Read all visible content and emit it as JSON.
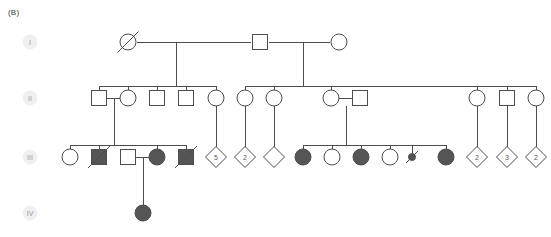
{
  "panel": {
    "label": "(B)"
  },
  "style": {
    "line_color": "#4d4d4d",
    "affected_fill": "#555555",
    "unaffected_fill": "#ffffff",
    "badge_fill": "#f0f0f0",
    "badge_text_color": "#9a9a9a",
    "background": "#ffffff"
  },
  "generations": [
    {
      "id": "I",
      "label": "I",
      "badge_x": 30,
      "badge_y": 42,
      "row_y": 42
    },
    {
      "id": "II",
      "label": "II",
      "badge_x": 30,
      "badge_y": 98,
      "row_y": 98
    },
    {
      "id": "III",
      "label": "III",
      "badge_x": 30,
      "badge_y": 157,
      "row_y": 157
    },
    {
      "id": "IV",
      "label": "IV",
      "badge_x": 30,
      "badge_y": 213,
      "row_y": 213
    }
  ],
  "symbols": [
    {
      "id": "I-1",
      "gen": "I",
      "sex": "female",
      "shape": "circle",
      "x": 128,
      "y": 42,
      "affected": false,
      "deceased": true,
      "count": null
    },
    {
      "id": "I-2",
      "gen": "I",
      "sex": "male",
      "shape": "square",
      "x": 260,
      "y": 42,
      "affected": false,
      "deceased": false,
      "count": null
    },
    {
      "id": "I-3",
      "gen": "I",
      "sex": "female",
      "shape": "circle",
      "x": 339,
      "y": 42,
      "affected": false,
      "deceased": false,
      "count": null
    },
    {
      "id": "II-1",
      "gen": "II",
      "sex": "male",
      "shape": "square",
      "x": 99,
      "y": 98,
      "affected": false,
      "deceased": false,
      "count": null
    },
    {
      "id": "II-2",
      "gen": "II",
      "sex": "female",
      "shape": "circle",
      "x": 128,
      "y": 98,
      "affected": false,
      "deceased": false,
      "count": null
    },
    {
      "id": "II-3",
      "gen": "II",
      "sex": "male",
      "shape": "square",
      "x": 157,
      "y": 98,
      "affected": false,
      "deceased": false,
      "count": null
    },
    {
      "id": "II-4",
      "gen": "II",
      "sex": "male",
      "shape": "square",
      "x": 186,
      "y": 98,
      "affected": false,
      "deceased": false,
      "count": null
    },
    {
      "id": "II-5",
      "gen": "II",
      "sex": "female",
      "shape": "circle",
      "x": 216,
      "y": 98,
      "affected": false,
      "deceased": false,
      "count": null
    },
    {
      "id": "II-6",
      "gen": "II",
      "sex": "female",
      "shape": "circle",
      "x": 245,
      "y": 98,
      "affected": false,
      "deceased": false,
      "count": null
    },
    {
      "id": "II-7",
      "gen": "II",
      "sex": "female",
      "shape": "circle",
      "x": 274,
      "y": 98,
      "affected": false,
      "deceased": false,
      "count": null
    },
    {
      "id": "II-8",
      "gen": "II",
      "sex": "female",
      "shape": "circle",
      "x": 331,
      "y": 98,
      "affected": false,
      "deceased": false,
      "count": null
    },
    {
      "id": "II-9",
      "gen": "II",
      "sex": "male",
      "shape": "square",
      "x": 360,
      "y": 98,
      "affected": false,
      "deceased": false,
      "count": null
    },
    {
      "id": "II-10",
      "gen": "II",
      "sex": "female",
      "shape": "circle",
      "x": 477,
      "y": 98,
      "affected": false,
      "deceased": false,
      "count": null
    },
    {
      "id": "II-11",
      "gen": "II",
      "sex": "male",
      "shape": "square",
      "x": 507,
      "y": 98,
      "affected": false,
      "deceased": false,
      "count": null
    },
    {
      "id": "II-12",
      "gen": "II",
      "sex": "female",
      "shape": "circle",
      "x": 536,
      "y": 98,
      "affected": false,
      "deceased": false,
      "count": null
    },
    {
      "id": "III-1",
      "gen": "III",
      "sex": "female",
      "shape": "circle",
      "x": 70,
      "y": 157,
      "affected": false,
      "deceased": false,
      "count": null
    },
    {
      "id": "III-2",
      "gen": "III",
      "sex": "male",
      "shape": "square",
      "x": 99,
      "y": 157,
      "affected": true,
      "deceased": true,
      "count": null
    },
    {
      "id": "III-3",
      "gen": "III",
      "sex": "male",
      "shape": "square",
      "x": 128,
      "y": 157,
      "affected": false,
      "deceased": false,
      "count": null
    },
    {
      "id": "III-4",
      "gen": "III",
      "sex": "female",
      "shape": "circle",
      "x": 157,
      "y": 157,
      "affected": true,
      "deceased": false,
      "count": null
    },
    {
      "id": "III-5",
      "gen": "III",
      "sex": "male",
      "shape": "square",
      "x": 186,
      "y": 157,
      "affected": true,
      "deceased": true,
      "count": null
    },
    {
      "id": "III-6",
      "gen": "III",
      "sex": "unknown",
      "shape": "diamond",
      "x": 216,
      "y": 157,
      "affected": false,
      "deceased": false,
      "count": "5"
    },
    {
      "id": "III-7",
      "gen": "III",
      "sex": "unknown",
      "shape": "diamond",
      "x": 245,
      "y": 157,
      "affected": false,
      "deceased": false,
      "count": "2"
    },
    {
      "id": "III-8",
      "gen": "III",
      "sex": "unknown",
      "shape": "diamond",
      "x": 274,
      "y": 157,
      "affected": false,
      "deceased": false,
      "count": null
    },
    {
      "id": "III-9",
      "gen": "III",
      "sex": "female",
      "shape": "circle",
      "x": 303,
      "y": 157,
      "affected": true,
      "deceased": false,
      "count": null
    },
    {
      "id": "III-10",
      "gen": "III",
      "sex": "female",
      "shape": "circle",
      "x": 332,
      "y": 157,
      "affected": false,
      "deceased": false,
      "count": null
    },
    {
      "id": "III-11",
      "gen": "III",
      "sex": "female",
      "shape": "circle",
      "x": 361,
      "y": 157,
      "affected": true,
      "deceased": false,
      "count": null
    },
    {
      "id": "III-12",
      "gen": "III",
      "sex": "female",
      "shape": "circle",
      "x": 390,
      "y": 157,
      "affected": false,
      "deceased": false,
      "count": null
    },
    {
      "id": "III-13",
      "gen": "III",
      "sex": "loss",
      "shape": "loss",
      "x": 412,
      "y": 157,
      "affected": true,
      "deceased": true,
      "count": null
    },
    {
      "id": "III-14",
      "gen": "III",
      "sex": "female",
      "shape": "circle",
      "x": 446,
      "y": 157,
      "affected": true,
      "deceased": false,
      "count": null
    },
    {
      "id": "III-15",
      "gen": "III",
      "sex": "unknown",
      "shape": "diamond",
      "x": 477,
      "y": 157,
      "affected": false,
      "deceased": false,
      "count": "2"
    },
    {
      "id": "III-16",
      "gen": "III",
      "sex": "unknown",
      "shape": "diamond",
      "x": 507,
      "y": 157,
      "affected": false,
      "deceased": false,
      "count": "3"
    },
    {
      "id": "III-17",
      "gen": "III",
      "sex": "unknown",
      "shape": "diamond",
      "x": 536,
      "y": 157,
      "affected": false,
      "deceased": false,
      "count": "2"
    },
    {
      "id": "IV-1",
      "gen": "IV",
      "sex": "female",
      "shape": "circle",
      "x": 143,
      "y": 213,
      "affected": true,
      "deceased": false,
      "count": null
    }
  ],
  "connectors": [
    {
      "id": "mate-I-1-I-2",
      "type": "mating-line",
      "points": "137,42 251,42"
    },
    {
      "id": "mate-I-2-I-3",
      "type": "mating-line",
      "points": "269,42 330,42"
    },
    {
      "id": "desc-I-1-drop",
      "type": "descent-drop",
      "points": "176,42 176,86"
    },
    {
      "id": "sib-II-left",
      "type": "sibship-line",
      "points": "99,86 216,86"
    },
    {
      "id": "stub-II-1",
      "type": "sibship-stub",
      "points": "99,86 99,91"
    },
    {
      "id": "stub-II-2",
      "type": "sibship-stub",
      "points": "128,86 128,91"
    },
    {
      "id": "stub-II-3",
      "type": "sibship-stub",
      "points": "157,86 157,91"
    },
    {
      "id": "stub-II-4",
      "type": "sibship-stub",
      "points": "186,86 186,91"
    },
    {
      "id": "stub-II-5",
      "type": "sibship-stub",
      "points": "216,86 216,91"
    },
    {
      "id": "desc-I-2-drop",
      "type": "descent-drop",
      "points": "303,42 303,86"
    },
    {
      "id": "sib-II-right",
      "type": "sibship-line",
      "points": "245,86 536,86"
    },
    {
      "id": "stub-II-6",
      "type": "sibship-stub",
      "points": "245,86 245,91"
    },
    {
      "id": "stub-II-7",
      "type": "sibship-stub",
      "points": "274,86 274,91"
    },
    {
      "id": "stub-II-8",
      "type": "sibship-stub",
      "points": "331,86 331,91"
    },
    {
      "id": "stub-II-10",
      "type": "sibship-stub",
      "points": "477,86 477,91"
    },
    {
      "id": "stub-II-11",
      "type": "sibship-stub",
      "points": "507,86 507,91"
    },
    {
      "id": "stub-II-12",
      "type": "sibship-stub",
      "points": "536,86 536,91"
    },
    {
      "id": "mate-II-1-II-2",
      "type": "mating-line",
      "points": "107,98 120,98"
    },
    {
      "id": "desc-II-1-drop",
      "type": "descent-drop",
      "points": "114,98 114,145"
    },
    {
      "id": "sib-III-left",
      "type": "sibship-line",
      "points": "70,145 186,145"
    },
    {
      "id": "stub-III-1",
      "type": "sibship-stub",
      "points": "70,145 70,150"
    },
    {
      "id": "stub-III-2",
      "type": "sibship-stub",
      "points": "99,145 99,150"
    },
    {
      "id": "stub-III-4",
      "type": "sibship-stub",
      "points": "157,145 157,150"
    },
    {
      "id": "stub-III-5",
      "type": "sibship-stub",
      "points": "186,145 186,150"
    },
    {
      "id": "line-II-5-III-6",
      "type": "single-descent",
      "points": "216,106 216,148"
    },
    {
      "id": "line-II-6-III-7",
      "type": "single-descent",
      "points": "245,106 245,148"
    },
    {
      "id": "line-II-7-III-8",
      "type": "single-descent",
      "points": "274,106 274,148"
    },
    {
      "id": "mate-III-3-III-4",
      "type": "mating-line",
      "points": "136,157 149,157"
    },
    {
      "id": "desc-III-3-drop",
      "type": "descent-drop",
      "points": "143,157 143,206"
    },
    {
      "id": "mate-II-8-II-9",
      "type": "mating-line",
      "points": "339,98 352,98"
    },
    {
      "id": "desc-II-8-drop",
      "type": "descent-drop",
      "points": "346,106 346,145"
    },
    {
      "id": "sib-III-mid",
      "type": "sibship-line",
      "points": "303,145 446,145"
    },
    {
      "id": "stub-III-9",
      "type": "sibship-stub",
      "points": "303,145 303,150"
    },
    {
      "id": "stub-III-10",
      "type": "sibship-stub",
      "points": "332,145 332,150"
    },
    {
      "id": "stub-III-11",
      "type": "sibship-stub",
      "points": "361,145 361,150"
    },
    {
      "id": "stub-III-12",
      "type": "sibship-stub",
      "points": "390,145 390,150"
    },
    {
      "id": "stub-III-13",
      "type": "sibship-stub",
      "points": "412,145 412,155"
    },
    {
      "id": "stub-III-14",
      "type": "sibship-stub",
      "points": "446,145 446,150"
    },
    {
      "id": "line-II-10-III-15",
      "type": "single-descent",
      "points": "477,106 477,148"
    },
    {
      "id": "line-II-11-III-16",
      "type": "single-descent",
      "points": "507,106 507,148"
    },
    {
      "id": "line-II-12-III-17",
      "type": "single-descent",
      "points": "536,106 536,148"
    }
  ]
}
